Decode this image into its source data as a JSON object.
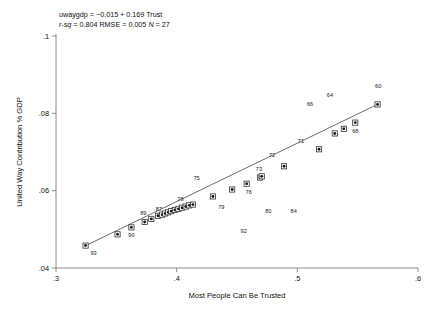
{
  "header": {
    "equation": "uwaygdp = −0.015 + 0.169 Trust",
    "stat_rsq_label": "r-sq",
    "stat_rsq_value": "= 0.804",
    "stat_rmse": "RMSE = 0.005",
    "stat_n_label": "N",
    "stat_n_value": "= 27"
  },
  "chart_data": {
    "type": "scatter",
    "title": "",
    "xlabel": "Most People Can Be Trusted",
    "ylabel": "United Way Contribution  % GDP",
    "xlim": [
      0.3,
      0.6
    ],
    "ylim": [
      0.04,
      0.1
    ],
    "xticks": [
      0.3,
      0.4,
      0.5,
      0.6
    ],
    "xtick_labels": [
      ".3",
      ".4",
      ".5",
      ".6"
    ],
    "yticks": [
      0.04,
      0.06,
      0.08,
      0.1
    ],
    "ytick_labels": [
      ".04",
      ".06",
      ".08",
      ".1"
    ],
    "grid": false,
    "legend": "none",
    "regression": {
      "intercept": -0.015,
      "slope": 0.169,
      "r_squared": 0.804,
      "rmse": 0.005,
      "n": 27,
      "line_x": [
        0.324,
        0.567
      ],
      "line_y": [
        0.0457,
        0.0824
      ]
    },
    "points": [
      {
        "label": "93",
        "x": 0.3245,
        "y": 0.0458,
        "label_dx": 8,
        "label_dy": 9
      },
      {
        "label": "",
        "x": 0.351,
        "y": 0.0487,
        "label_dx": 0,
        "label_dy": 0
      },
      {
        "label": "90",
        "x": 0.3625,
        "y": 0.0505,
        "label_dx": 0,
        "label_dy": 10
      },
      {
        "label": "",
        "x": 0.3735,
        "y": 0.0519,
        "label_dx": 0,
        "label_dy": 0
      },
      {
        "label": "89",
        "x": 0.379,
        "y": 0.0527,
        "label_dx": -8,
        "label_dy": -4
      },
      {
        "label": "87",
        "x": 0.3845,
        "y": 0.0535,
        "label_dx": 1,
        "label_dy": -5
      },
      {
        "label": "",
        "x": 0.388,
        "y": 0.0538,
        "label_dx": 0,
        "label_dy": 0
      },
      {
        "label": "",
        "x": 0.3905,
        "y": 0.0541,
        "label_dx": 0,
        "label_dy": 0
      },
      {
        "label": "",
        "x": 0.393,
        "y": 0.0544,
        "label_dx": 0,
        "label_dy": 0
      },
      {
        "label": "",
        "x": 0.3955,
        "y": 0.0547,
        "label_dx": 0,
        "label_dy": 0
      },
      {
        "label": "",
        "x": 0.3985,
        "y": 0.055,
        "label_dx": 0,
        "label_dy": 0
      },
      {
        "label": "78",
        "x": 0.4015,
        "y": 0.0553,
        "label_dx": 2,
        "label_dy": -8
      },
      {
        "label": "",
        "x": 0.4045,
        "y": 0.0556,
        "label_dx": 0,
        "label_dy": 0
      },
      {
        "label": "",
        "x": 0.4075,
        "y": 0.0559,
        "label_dx": 0,
        "label_dy": 0
      },
      {
        "label": "",
        "x": 0.4105,
        "y": 0.0562,
        "label_dx": 0,
        "label_dy": 0
      },
      {
        "label": "",
        "x": 0.4135,
        "y": 0.0564,
        "label_dx": 0,
        "label_dy": 0
      },
      {
        "label": "",
        "x": 0.43,
        "y": 0.0585,
        "label_dx": 0,
        "label_dy": 0
      },
      {
        "label": "",
        "x": 0.446,
        "y": 0.0603,
        "label_dx": 0,
        "label_dy": 0
      },
      {
        "label": "76",
        "x": 0.458,
        "y": 0.0618,
        "label_dx": 2,
        "label_dy": 10
      },
      {
        "label": "73",
        "x": 0.469,
        "y": 0.0634,
        "label_dx": -1,
        "label_dy": -7
      },
      {
        "label": "",
        "x": 0.4705,
        "y": 0.0637,
        "label_dx": 0,
        "label_dy": 0
      },
      {
        "label": "",
        "x": 0.489,
        "y": 0.0663,
        "label_dx": 0,
        "label_dy": 0
      },
      {
        "label": "",
        "x": 0.518,
        "y": 0.0707,
        "label_dx": 0,
        "label_dy": 0
      },
      {
        "label": "",
        "x": 0.531,
        "y": 0.0748,
        "label_dx": 0,
        "label_dy": 0
      },
      {
        "label": "",
        "x": 0.5385,
        "y": 0.076,
        "label_dx": 0,
        "label_dy": 0
      },
      {
        "label": "68",
        "x": 0.548,
        "y": 0.0776,
        "label_dx": 0,
        "label_dy": 10
      },
      {
        "label": "",
        "x": 0.5665,
        "y": 0.0823,
        "label_dx": 0,
        "label_dy": 0
      }
    ],
    "floating_labels": [
      {
        "label": "60",
        "x": 0.567,
        "y": 0.0866
      },
      {
        "label": "64",
        "x": 0.527,
        "y": 0.0843
      },
      {
        "label": "66",
        "x": 0.5105,
        "y": 0.0818
      },
      {
        "label": "71",
        "x": 0.503,
        "y": 0.0724
      },
      {
        "label": "72",
        "x": 0.479,
        "y": 0.0688
      },
      {
        "label": "75",
        "x": 0.4165,
        "y": 0.0628
      },
      {
        "label": "79",
        "x": 0.437,
        "y": 0.0553
      },
      {
        "label": "80",
        "x": 0.476,
        "y": 0.0543
      },
      {
        "label": "84",
        "x": 0.497,
        "y": 0.0543
      },
      {
        "label": "92",
        "x": 0.4555,
        "y": 0.049
      }
    ]
  }
}
